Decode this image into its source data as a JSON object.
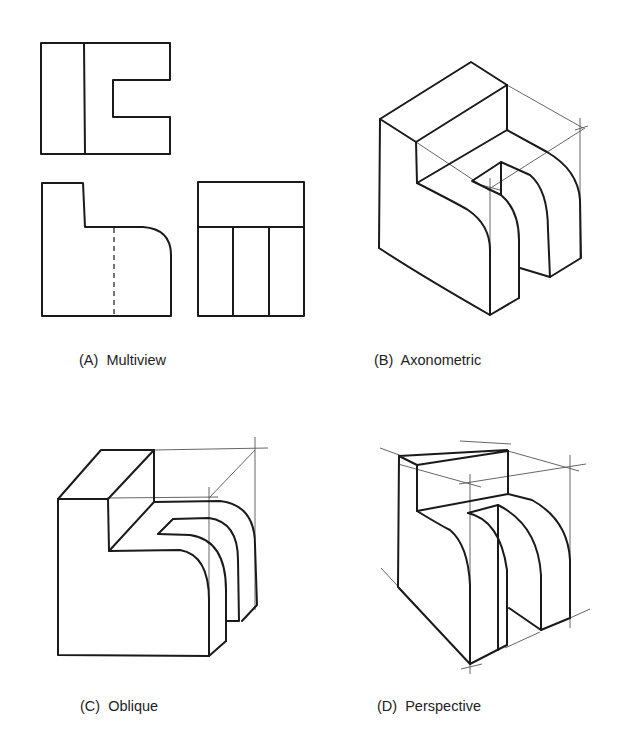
{
  "figure": {
    "panels": [
      {
        "id": "A",
        "caption": "(A)  Multiview",
        "views": [
          "top-view",
          "front-view",
          "side-view"
        ]
      },
      {
        "id": "B",
        "caption": "(B)  Axonometric"
      },
      {
        "id": "C",
        "caption": "(C)  Oblique"
      },
      {
        "id": "D",
        "caption": "(D)  Perspective"
      }
    ],
    "colors": {
      "line": "#1a1a1a",
      "construction_line": "#555555",
      "background": "#ffffff"
    }
  }
}
